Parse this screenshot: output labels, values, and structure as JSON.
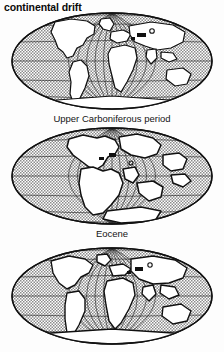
{
  "figure": {
    "title": "continental drift",
    "background_color": "#fdfdfd",
    "ink_color": "#111111",
    "ocean_color": "#b9b9b9",
    "land_color": "#ffffff",
    "projection": "elliptical (Mollweide-style) world map",
    "panel_count": 3
  },
  "panels": [
    {
      "index": 1,
      "caption": "",
      "description": "Present-day configuration of the continents; oceans shown with gray stipple, landmasses white with heavy outlines.",
      "graticule": {
        "meridians": 12,
        "parallels": 7
      }
    },
    {
      "index": 2,
      "caption": "Upper Carboniferous period",
      "description": "Landmasses clustered together into a single supercontinent (Pangaea) straddling the centre of the map.",
      "graticule": {
        "meridians": 12,
        "parallels": 7
      }
    },
    {
      "index": 3,
      "caption": "Eocene",
      "description": "Continents partially separated and drifting toward their modern positions; panel is clipped by the bottom edge of the image.",
      "graticule": {
        "meridians": 12,
        "parallels": 7
      }
    }
  ],
  "captions": {
    "first": "Upper Carboniferous period",
    "second": "Eocene"
  },
  "legend": {
    "ocean_label": "ocean (stippled)",
    "land_label": "land (white)"
  }
}
